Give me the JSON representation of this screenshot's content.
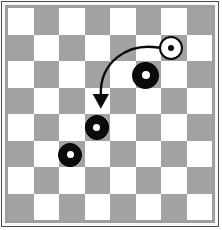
{
  "diagram": {
    "title": "Checkers board move diagram",
    "board": {
      "rows": 8,
      "columns": 8,
      "light_color": "#ffffff",
      "dark_color": "#a3a3a3",
      "orientation_note": "top-left square is light",
      "cells": [
        [
          "light",
          "dark",
          "light",
          "dark",
          "light",
          "dark",
          "light",
          "dark"
        ],
        [
          "dark",
          "light",
          "dark",
          "light",
          "dark",
          "light",
          "dark",
          "light"
        ],
        [
          "light",
          "dark",
          "light",
          "dark",
          "light",
          "dark",
          "light",
          "dark"
        ],
        [
          "dark",
          "light",
          "dark",
          "light",
          "dark",
          "light",
          "dark",
          "light"
        ],
        [
          "light",
          "dark",
          "light",
          "dark",
          "light",
          "dark",
          "light",
          "dark"
        ],
        [
          "dark",
          "light",
          "dark",
          "light",
          "dark",
          "light",
          "dark",
          "light"
        ],
        [
          "light",
          "dark",
          "light",
          "dark",
          "light",
          "dark",
          "light",
          "dark"
        ],
        [
          "dark",
          "light",
          "dark",
          "light",
          "dark",
          "light",
          "dark",
          "light"
        ]
      ]
    },
    "frame": {
      "outer_border_color": "#4b4b4b",
      "gap_color": "#f7f7f7",
      "inner_border_color": "#9e9e9e"
    },
    "pieces": [
      {
        "id": "white-piece-1",
        "color": "white",
        "label": "white king piece",
        "row": 1,
        "column": 7,
        "left_pct": 74.0,
        "top_pct": 13.0,
        "size_pct": 12.0
      },
      {
        "id": "black-piece-1",
        "color": "black",
        "label": "black king piece",
        "row": 2,
        "column": 6,
        "left_pct": 61.0,
        "top_pct": 25.5,
        "size_pct": 13.0
      },
      {
        "id": "black-piece-2",
        "color": "black",
        "label": "black king piece",
        "row": 4,
        "column": 4,
        "left_pct": 37.5,
        "top_pct": 50.5,
        "size_pct": 12.0
      },
      {
        "id": "black-piece-3",
        "color": "black",
        "label": "black king piece",
        "row": 5,
        "column": 3,
        "left_pct": 24.5,
        "top_pct": 63.5,
        "size_pct": 12.0
      }
    ],
    "arrow": {
      "id": "move-arrow",
      "label": "curved move arrow",
      "color": "#0b0b0b",
      "stroke_width": 2.4,
      "start": {
        "x_pct": 76.0,
        "y_pct": 19.0
      },
      "control_1": {
        "x_pct": 58.0,
        "y_pct": 15.5
      },
      "control_2": {
        "x_pct": 45.0,
        "y_pct": 26.0
      },
      "end": {
        "x_pct": 45.5,
        "y_pct": 41.0
      },
      "head": {
        "x_pct": 45.5,
        "y_pct": 47.5,
        "width_pct": 8.0,
        "height_pct": 9.0
      }
    }
  }
}
